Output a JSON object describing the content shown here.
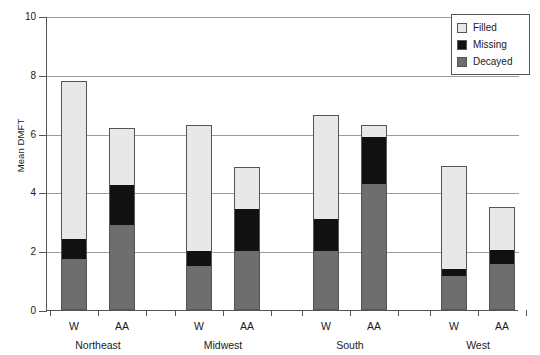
{
  "chart_data": {
    "type": "bar",
    "title": "",
    "subtitle": "",
    "xlabel": "",
    "ylabel": "Mean DMFT",
    "ylim": [
      0,
      10
    ],
    "yticks": [
      0,
      2,
      4,
      6,
      8,
      10
    ],
    "ytick_labels": [
      "0",
      "2",
      "4",
      "6",
      "8",
      "10"
    ],
    "grid": true,
    "stacked": true,
    "legend_position": "top-right",
    "legend": [
      "Filled",
      "Missing",
      "Decayed"
    ],
    "groups": [
      "Northeast",
      "Midwest",
      "South",
      "West"
    ],
    "categories": [
      "W",
      "AA",
      "W",
      "AA",
      "W",
      "AA",
      "W",
      "AA"
    ],
    "series": [
      {
        "name": "Decayed",
        "color": "#6e6e6e",
        "values": [
          1.75,
          2.9,
          1.5,
          2.0,
          2.0,
          4.3,
          1.15,
          1.55
        ]
      },
      {
        "name": "Missing",
        "color": "#111111",
        "values": [
          0.65,
          1.35,
          0.5,
          1.45,
          1.1,
          1.6,
          0.25,
          0.5
        ]
      },
      {
        "name": "Filled",
        "color": "#e8e8e8",
        "values": [
          5.4,
          1.95,
          4.3,
          1.4,
          3.55,
          0.4,
          3.5,
          1.45
        ]
      }
    ],
    "totals": [
      7.8,
      6.2,
      6.3,
      4.85,
      6.65,
      6.3,
      4.9,
      3.5
    ]
  },
  "legend": {
    "items": [
      {
        "label": "Filled",
        "swatch": "filled"
      },
      {
        "label": "Missing",
        "swatch": "missing"
      },
      {
        "label": "Decayed",
        "swatch": "decayed"
      }
    ]
  },
  "axes": {
    "y_label": "Mean DMFT",
    "y_ticks": [
      "0",
      "2",
      "4",
      "6",
      "8",
      "10"
    ]
  },
  "colors": {
    "filled": "#e8e8e8",
    "missing": "#111111",
    "decayed": "#6e6e6e",
    "axis": "#555555",
    "grid": "#9b9b9b",
    "background": "#ffffff"
  }
}
